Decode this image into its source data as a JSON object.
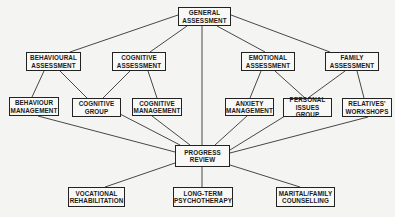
{
  "diagram": {
    "nodes": [
      {
        "id": "general",
        "label": "GENERAL\nASSESSMENT",
        "x": 178,
        "y": 7,
        "w": 53,
        "h": 19
      },
      {
        "id": "beh_assess",
        "label": "BEHAVIOURAL\nASSESSMENT",
        "x": 26,
        "y": 52,
        "w": 55,
        "h": 19
      },
      {
        "id": "cog_assess",
        "label": "COGNITIVE\nASSESSMENT",
        "x": 112,
        "y": 52,
        "w": 54,
        "h": 19
      },
      {
        "id": "emo_assess",
        "label": "EMOTIONAL\nASSESSMENT",
        "x": 241,
        "y": 52,
        "w": 54,
        "h": 19
      },
      {
        "id": "fam_assess",
        "label": "FAMILY\nASSESSMENT",
        "x": 325,
        "y": 52,
        "w": 54,
        "h": 19
      },
      {
        "id": "beh_mgmt",
        "label": "BEHAVIOUR\nMANAGEMENT",
        "x": 9,
        "y": 97,
        "w": 50,
        "h": 19
      },
      {
        "id": "cog_group",
        "label": "COGNITIVE\nGROUP",
        "x": 72,
        "y": 98,
        "w": 49,
        "h": 19
      },
      {
        "id": "cog_mgmt",
        "label": "COGNITIVE\nMANAGEMENT",
        "x": 132,
        "y": 98,
        "w": 50,
        "h": 18
      },
      {
        "id": "anx_mgmt",
        "label": "ANXIETY\nMANAGEMENT",
        "x": 225,
        "y": 98,
        "w": 49,
        "h": 18
      },
      {
        "id": "personal",
        "label": "PERSONAL\nISSUES GROUP",
        "x": 283,
        "y": 98,
        "w": 49,
        "h": 19
      },
      {
        "id": "relatives",
        "label": "RELATIVES'\nWORKSHOPS",
        "x": 342,
        "y": 98,
        "w": 50,
        "h": 19
      },
      {
        "id": "progress",
        "label": "PROGRESS\nREVIEW",
        "x": 175,
        "y": 145,
        "w": 55,
        "h": 22
      },
      {
        "id": "vocational",
        "label": "VOCATIONAL\nREHABILITATION",
        "x": 68,
        "y": 187,
        "w": 57,
        "h": 20
      },
      {
        "id": "longterm",
        "label": "LONG-TERM\nPSYCHOTHERAPY",
        "x": 173,
        "y": 187,
        "w": 60,
        "h": 20
      },
      {
        "id": "marital",
        "label": "MARITAL/FAMILY\nCOUNSELLING",
        "x": 276,
        "y": 187,
        "w": 59,
        "h": 20
      }
    ],
    "edges": [
      {
        "x1": 178,
        "y1": 15,
        "x2": 70,
        "y2": 52
      },
      {
        "x1": 187,
        "y1": 26,
        "x2": 150,
        "y2": 52
      },
      {
        "x1": 202,
        "y1": 26,
        "x2": 202,
        "y2": 145
      },
      {
        "x1": 217,
        "y1": 26,
        "x2": 265,
        "y2": 52
      },
      {
        "x1": 231,
        "y1": 15,
        "x2": 330,
        "y2": 52
      },
      {
        "x1": 44,
        "y1": 71,
        "x2": 32,
        "y2": 97
      },
      {
        "x1": 60,
        "y1": 71,
        "x2": 87,
        "y2": 98
      },
      {
        "x1": 130,
        "y1": 71,
        "x2": 103,
        "y2": 98
      },
      {
        "x1": 148,
        "y1": 71,
        "x2": 157,
        "y2": 98
      },
      {
        "x1": 261,
        "y1": 71,
        "x2": 250,
        "y2": 98
      },
      {
        "x1": 275,
        "y1": 71,
        "x2": 305,
        "y2": 98
      },
      {
        "x1": 345,
        "y1": 71,
        "x2": 308,
        "y2": 98
      },
      {
        "x1": 357,
        "y1": 71,
        "x2": 364,
        "y2": 98
      },
      {
        "x1": 38,
        "y1": 116,
        "x2": 175,
        "y2": 152
      },
      {
        "x1": 120,
        "y1": 114,
        "x2": 180,
        "y2": 145
      },
      {
        "x1": 152,
        "y1": 116,
        "x2": 190,
        "y2": 145
      },
      {
        "x1": 247,
        "y1": 116,
        "x2": 215,
        "y2": 145
      },
      {
        "x1": 285,
        "y1": 116,
        "x2": 230,
        "y2": 150
      },
      {
        "x1": 368,
        "y1": 117,
        "x2": 230,
        "y2": 153
      },
      {
        "x1": 175,
        "y1": 163,
        "x2": 105,
        "y2": 187
      },
      {
        "x1": 202,
        "y1": 167,
        "x2": 202,
        "y2": 187
      },
      {
        "x1": 230,
        "y1": 165,
        "x2": 300,
        "y2": 187
      }
    ],
    "colors": {
      "line": "#333333",
      "border": "#222222",
      "background": "#f4f4f2"
    }
  }
}
